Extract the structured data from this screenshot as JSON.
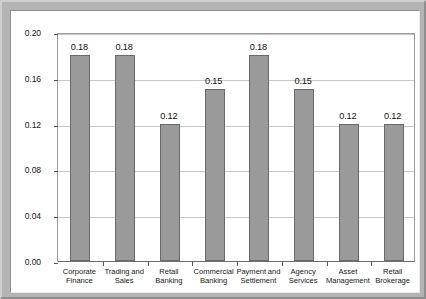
{
  "chart_data": {
    "type": "bar",
    "title": "",
    "subtitle": "",
    "xlabel": "",
    "ylabel": "",
    "categories": [
      "Corporate Finance",
      "Trading and Sales",
      "Retail Banking",
      "Commercial Banking",
      "Payment and Settlement",
      "Agency Services",
      "Asset Management",
      "Retail Brokerage"
    ],
    "category_lines": [
      [
        "Corporate",
        "Finance"
      ],
      [
        "Trading and",
        "Sales"
      ],
      [
        "Retail",
        "Banking"
      ],
      [
        "Commercial",
        "Banking"
      ],
      [
        "Payment and",
        "Settlement"
      ],
      [
        "Agency",
        "Services"
      ],
      [
        "Asset",
        "Management"
      ],
      [
        "Retail",
        "Brokerage"
      ]
    ],
    "values": [
      0.18,
      0.18,
      0.12,
      0.15,
      0.18,
      0.15,
      0.12,
      0.12
    ],
    "value_labels": [
      "0.18",
      "0.18",
      "0.12",
      "0.15",
      "0.18",
      "0.15",
      "0.12",
      "0.12"
    ],
    "ylim": [
      0.0,
      0.2
    ],
    "ytick_values": [
      0.0,
      0.04,
      0.08,
      0.12,
      0.16,
      0.2
    ],
    "ytick_labels": [
      "0.00",
      "0.04",
      "0.08",
      "0.12",
      "0.16",
      "0.20"
    ],
    "grid": true,
    "grid_axis": "y",
    "legend": false,
    "legend_position": "none",
    "bar_fill_color": "#9a9a9a",
    "bar_edge_color": "#6a6a6a",
    "gridline_color": "#c9c9c9",
    "axis_color": "#6e6e6e",
    "plot_background": "#ffffff",
    "figure_frame_color": "#b4b4b4"
  }
}
